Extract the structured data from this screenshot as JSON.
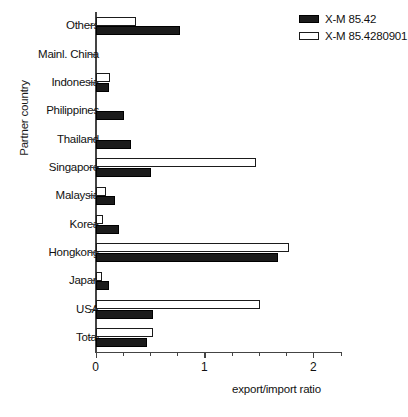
{
  "chart_data": {
    "type": "bar",
    "orientation": "horizontal",
    "title": "",
    "xlabel": "export/import ratio",
    "ylabel": "Partner country",
    "xlim": [
      0,
      2.25
    ],
    "xticks_major": [
      0,
      1,
      2
    ],
    "xtick_labels": [
      "0",
      "1",
      "2"
    ],
    "xticks_minor": [
      0.25,
      0.5,
      0.75,
      1.25,
      1.5,
      1.75,
      2.25
    ],
    "grid": false,
    "legend_position": "top-right",
    "categories": [
      "Others",
      "Mainl. China",
      "Indonesia",
      "Philippines",
      "Thailand",
      "Singapore",
      "Malaysia",
      "Korea",
      "Hongkong",
      "Japan",
      "USA",
      "Total"
    ],
    "series": [
      {
        "name": "X-M 85.42",
        "style": "filled",
        "color": "#1b1b1b",
        "values": [
          0.78,
          0.0,
          0.12,
          0.26,
          0.33,
          0.51,
          0.18,
          0.22,
          1.68,
          0.12,
          0.53,
          0.47
        ]
      },
      {
        "name": "X-M 85.4280901",
        "style": "open",
        "color": "#ffffff",
        "values": [
          0.37,
          0.0,
          0.13,
          0.0,
          0.0,
          1.47,
          0.1,
          0.07,
          1.78,
          0.06,
          1.51,
          0.53
        ]
      }
    ]
  },
  "legend": {
    "items": [
      {
        "label": "X-M 85.42",
        "style": "filled"
      },
      {
        "label": "X-M 85.4280901",
        "style": "open"
      }
    ]
  }
}
